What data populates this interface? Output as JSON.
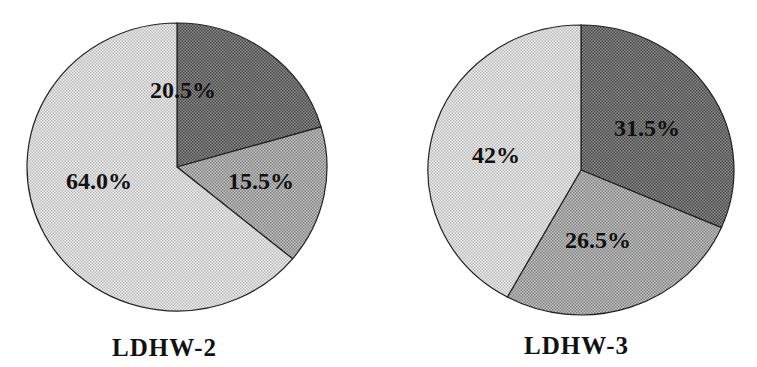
{
  "chart_data": [
    {
      "type": "pie",
      "title": "LDHW-2",
      "categories": [
        "Slice 1 (dark)",
        "Slice 2 (medium)",
        "Slice 3 (light)"
      ],
      "values": [
        20.5,
        15.5,
        64.0
      ],
      "labels": [
        "20.5%",
        "15.5%",
        "64.0%"
      ],
      "start_angle_deg": 90,
      "direction": "clockwise"
    },
    {
      "type": "pie",
      "title": "LDHW-3",
      "categories": [
        "Slice 1 (dark)",
        "Slice 2 (medium)",
        "Slice 3 (light)"
      ],
      "values": [
        31.5,
        26.5,
        42
      ],
      "labels": [
        "31.5%",
        "26.5%",
        "42%"
      ],
      "start_angle_deg": 90,
      "direction": "clockwise"
    }
  ],
  "charts": [
    {
      "title": "LDHW-2",
      "labels": [
        "20.5%",
        "15.5%",
        "64.0%"
      ]
    },
    {
      "title": "LDHW-3",
      "labels": [
        "31.5%",
        "26.5%",
        "42%"
      ]
    }
  ],
  "colors": {
    "dark": "#6e6e6e",
    "medium": "#a4a4a4",
    "light": "#d8d8d8"
  }
}
